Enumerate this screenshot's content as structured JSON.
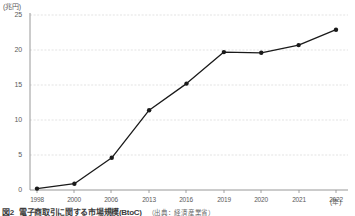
{
  "chart_data": {
    "type": "line",
    "title": "",
    "unit_label": "(兆円)",
    "xlabel": "(年)",
    "ylabel": "",
    "categories": [
      "1998",
      "2000",
      "2006",
      "2013",
      "2016",
      "2019",
      "2020",
      "2021",
      "2022"
    ],
    "x": [
      1998,
      2000,
      2006,
      2013,
      2016,
      2019,
      2020,
      2021,
      2022
    ],
    "values": [
      0.2,
      0.9,
      4.6,
      11.4,
      15.2,
      19.7,
      19.6,
      20.7,
      22.9
    ],
    "series": [
      {
        "name": "電子商取引市場規模",
        "values": [
          0.2,
          0.9,
          4.6,
          11.4,
          15.2,
          19.7,
          19.6,
          20.7,
          22.9
        ]
      }
    ],
    "ylim": [
      0,
      25
    ],
    "yticks": [
      "0",
      "5",
      "10",
      "15",
      "20",
      "25"
    ],
    "ytick_values": [
      0,
      5,
      10,
      15,
      20,
      25
    ],
    "grid": true,
    "grid_axis": "y",
    "legend": false,
    "legend_position": "none",
    "marker": "circle",
    "line_color": "#1a1a1a",
    "marker_color": "#1a1a1a",
    "grid_color": "#d8d8d8",
    "axis_color": "#999999"
  },
  "caption": {
    "label": "図2",
    "title": "電子商取引に関する市場規模",
    "note": "(BtoC)",
    "source": "（出典：経済産業省）"
  }
}
